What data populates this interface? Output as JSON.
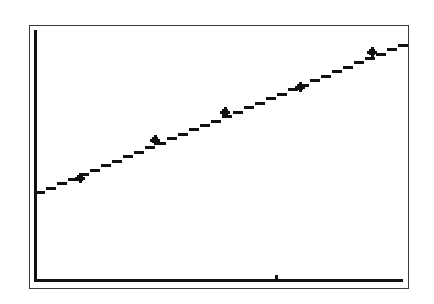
{
  "chart_data": {
    "type": "scatter",
    "title": "",
    "xlabel": "",
    "ylabel": "",
    "grid": false,
    "legend": null,
    "points": [
      {
        "x": 1,
        "y": 1
      },
      {
        "x": 2,
        "y": 2
      },
      {
        "x": 3,
        "y": 3
      },
      {
        "x": 4,
        "y": 4
      },
      {
        "x": 5,
        "y": 5
      }
    ],
    "regression_line": {
      "type": "linear",
      "x_start": 0,
      "y_start": 0,
      "x_end": 6,
      "y_end": 6
    },
    "x_axis_tick_count": 1,
    "pixel_points": [
      [
        80,
        178
      ],
      [
        155,
        140
      ],
      [
        225,
        112
      ],
      [
        300,
        87
      ],
      [
        372,
        52
      ]
    ],
    "pixel_line": [
      [
        35,
        192
      ],
      [
        402,
        43
      ]
    ],
    "mark_style": "plus",
    "colors": {
      "foreground": "#111111",
      "background": "#ffffff",
      "border": "#3a3a3a"
    }
  }
}
